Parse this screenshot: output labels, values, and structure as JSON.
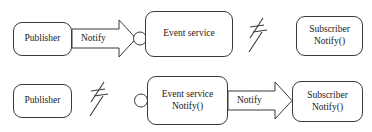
{
  "diagram": {
    "background_color": "#ffffff",
    "stroke_color": "#3a3a3a",
    "text_color": "#1a1a1a",
    "rows": [
      {
        "id": "row-1",
        "nodes": [
          {
            "id": "publisher-1",
            "lines": [
              "Publisher"
            ]
          },
          {
            "id": "event-service-1",
            "lines": [
              "Event service"
            ]
          },
          {
            "id": "subscriber-1",
            "lines": [
              "Subscriber",
              "Notify()"
            ]
          }
        ],
        "arrow_label": "Notify",
        "connector": "socket-circle",
        "break_symbol": "broken-link"
      },
      {
        "id": "row-2",
        "nodes": [
          {
            "id": "publisher-2",
            "lines": [
              "Publisher"
            ]
          },
          {
            "id": "event-service-2",
            "lines": [
              "Event service",
              "Notify()"
            ]
          },
          {
            "id": "subscriber-2",
            "lines": [
              "Subscriber",
              "Notify()"
            ]
          }
        ],
        "arrow_label": "Notify",
        "connector": "socket-circle",
        "break_symbol": "broken-link"
      }
    ]
  }
}
